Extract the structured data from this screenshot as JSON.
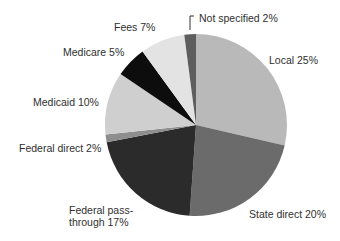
{
  "chart_data": {
    "type": "pie",
    "title": "",
    "center": [
      196,
      125
    ],
    "radius": 91,
    "slices": [
      {
        "label": "Local 25%",
        "name": "Local",
        "value": 25,
        "start": 0,
        "end": 103,
        "color": "#b9b9b9"
      },
      {
        "label": "State direct 20%",
        "name": "State direct",
        "value": 20,
        "start": 103,
        "end": 184,
        "color": "#6b6b6b"
      },
      {
        "label": "Federal pass-through 17%",
        "name": "Federal pass-through",
        "value": 17,
        "start": 184,
        "end": 259,
        "color": "#2b2b2b"
      },
      {
        "label": "Federal direct 2%",
        "name": "Federal direct",
        "value": 2,
        "start": 259,
        "end": 264,
        "color": "#8e8e8e"
      },
      {
        "label": "Medicaid 10%",
        "name": "Medicaid",
        "value": 10,
        "start": 264,
        "end": 304,
        "color": "#cfcfcf"
      },
      {
        "label": "Medicare 5%",
        "name": "Medicare",
        "value": 5,
        "start": 304,
        "end": 324,
        "color": "#0d0d0d"
      },
      {
        "label": "Fees 7%",
        "name": "Fees",
        "value": 7,
        "start": 324,
        "end": 352.6,
        "color": "#e3e3e3"
      },
      {
        "label": "Not specified 2%",
        "name": "Not specified",
        "value": 2,
        "start": 352.6,
        "end": 360,
        "color": "#5e5e5e"
      }
    ],
    "labels": {
      "local": "Local 25%",
      "state": "State direct 20%",
      "fed_pass_1": "Federal pass-",
      "fed_pass_2": "through 17%",
      "fed_direct": "Federal direct 2%",
      "medicaid": "Medicaid 10%",
      "medicare": "Medicare 5%",
      "fees": "Fees 7%",
      "not_specified": "Not specified 2%"
    },
    "legend": "none (direct labels)"
  }
}
